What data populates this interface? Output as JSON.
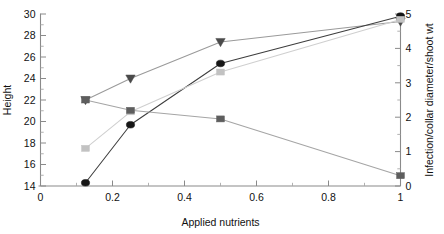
{
  "chart_data": {
    "type": "line",
    "title": "",
    "xlabel": "Applied nutrients",
    "ylabel": "Height",
    "y2label": "Infection/collar diameter/shoot wt",
    "xlim": [
      0,
      1
    ],
    "ylim": [
      14,
      30
    ],
    "y2lim": [
      0,
      5
    ],
    "xticks": [
      0,
      0.2,
      0.4,
      0.6,
      0.8,
      1
    ],
    "xticklabels": [
      "0",
      "0.2",
      "0.4",
      "0.6",
      "0.8",
      "1"
    ],
    "yticks": [
      14,
      16,
      18,
      20,
      22,
      24,
      26,
      28,
      30
    ],
    "yticklabels": [
      "14",
      "16",
      "18",
      "20",
      "22",
      "24",
      "26",
      "28",
      "30"
    ],
    "y2ticks": [
      0,
      1,
      2,
      3,
      4,
      5
    ],
    "y2ticklabels": [
      "0",
      "1",
      "2",
      "3",
      "4",
      "5"
    ],
    "x": [
      0.125,
      0.25,
      0.5,
      1.0
    ],
    "grid": false,
    "legend": "none",
    "series": [
      {
        "name": "height-triangles",
        "marker": "triangle-down",
        "axis": "left",
        "color": "#4a4a4a",
        "line_color": "#9a9a9a",
        "values": [
          22.0,
          24.0,
          27.4,
          29.3
        ]
      },
      {
        "name": "height-circles",
        "marker": "circle",
        "axis": "left",
        "color": "#161616",
        "line_color": "#3d3d3d",
        "values": [
          14.3,
          19.7,
          25.4,
          29.8
        ]
      },
      {
        "name": "height-light-squares",
        "marker": "square",
        "axis": "left",
        "color": "#c2c2c2",
        "line_color": "#cfcfcf",
        "values": [
          17.5,
          20.9,
          24.6,
          29.5
        ]
      },
      {
        "name": "infection-dark-squares",
        "marker": "square",
        "axis": "right",
        "color": "#5e5e5e",
        "line_color": "#a5a5a5",
        "values": [
          2.5,
          2.2,
          1.95,
          0.3
        ]
      }
    ]
  },
  "axes": {
    "x_title": "Applied nutrients",
    "y_left_title": "Height",
    "y_right_title": "Infection/collar diameter/shoot wt"
  }
}
